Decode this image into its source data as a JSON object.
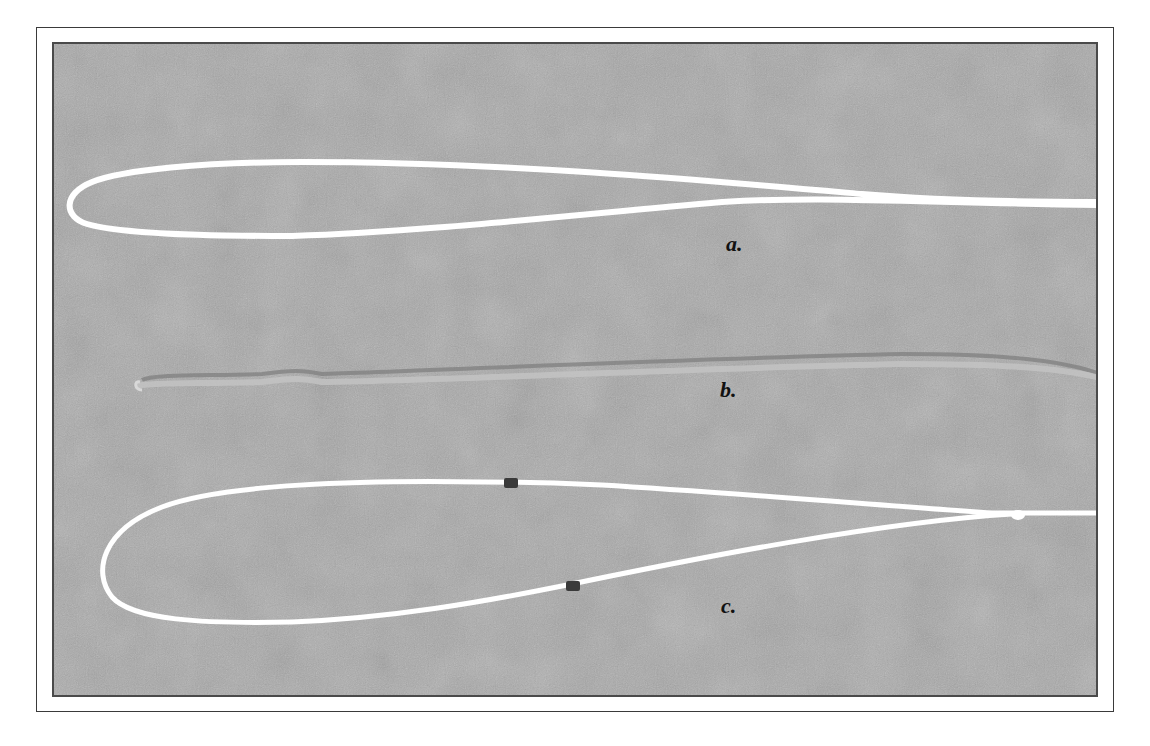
{
  "figure": {
    "type": "photograph",
    "background_color": "#a9a9a9",
    "frame_color": "#3a3a3a",
    "line_color": "#ffffff",
    "specimens": [
      {
        "id": "a",
        "label": "a.",
        "description": "long narrow white loop, open end on right"
      },
      {
        "id": "b",
        "label": "b.",
        "description": "flattened/collapsed strand, faint grey"
      },
      {
        "id": "c",
        "label": "c.",
        "description": "wide white loop with two dark marker bands, tapering to a single line on right"
      }
    ]
  }
}
